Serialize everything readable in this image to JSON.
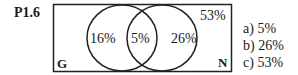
{
  "problem": {
    "label": "P1.6"
  },
  "venn": {
    "set_left": "G",
    "set_right": "N",
    "only_left": "16%",
    "intersection": "5%",
    "only_right": "26%",
    "outside": "53%"
  },
  "options": [
    {
      "text": "a) 5%"
    },
    {
      "text": "b) 26%"
    },
    {
      "text": "c) 53%"
    }
  ]
}
